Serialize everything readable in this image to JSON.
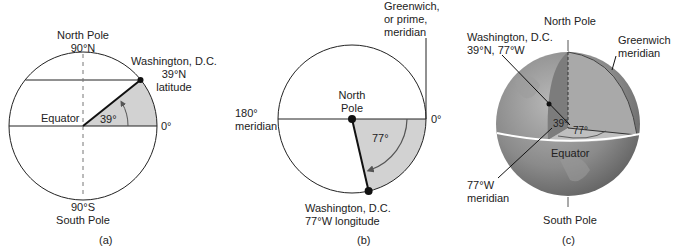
{
  "panel_a": {
    "north_pole": "North Pole",
    "north_lat": "90°N",
    "dc_name": "Washington, D.C.",
    "dc_lat": "39°N",
    "dc_lat_word": "latitude",
    "equator": "Equator",
    "angle": "39°",
    "zero": "0°",
    "south_lat": "90°S",
    "south_pole": "South Pole",
    "caption": "(a)"
  },
  "panel_b": {
    "greenwich_1": "Greenwich,",
    "greenwich_2": "or prime,",
    "greenwich_3": "meridian",
    "m180_1": "180°",
    "m180_2": "meridian",
    "north_1": "North",
    "north_2": "Pole",
    "angle": "77°",
    "zero": "0°",
    "dc_name": "Washington, D.C.",
    "dc_lon": "77°W longitude",
    "caption": "(b)"
  },
  "panel_c": {
    "north_pole": "North Pole",
    "dc_name": "Washington, D.C.",
    "dc_coords": "39°N, 77°W",
    "greenwich_1": "Greenwich",
    "greenwich_2": "meridian",
    "lat_angle": "39°",
    "lon_angle": "77°",
    "equator": "Equator",
    "meridian_1": "77°W",
    "meridian_2": "meridian",
    "south_pole": "South Pole",
    "caption": "(c)"
  },
  "colors": {
    "shade": "#d2d2d2",
    "line": "#222222",
    "arrow": "#555555",
    "globe_dark": "#6e6e6e",
    "globe_light": "#b5b5b5"
  }
}
